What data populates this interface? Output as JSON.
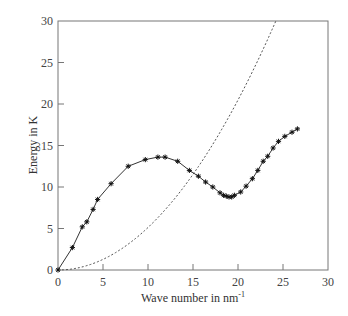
{
  "chart_data": {
    "type": "line",
    "title": "",
    "xlabel": "Wave number in nm",
    "xlabel_superscript": "-1",
    "ylabel": "Energy in K",
    "xlim": [
      0,
      30
    ],
    "ylim": [
      0,
      30
    ],
    "xticks": [
      0,
      5,
      10,
      15,
      20,
      25,
      30
    ],
    "yticks": [
      0,
      5,
      10,
      15,
      20,
      25,
      30
    ],
    "grid": false,
    "legend": null,
    "series": [
      {
        "name": "measured dispersion (markers)",
        "style": "markers-with-solid-line",
        "marker": "asterisk",
        "color": "#222222",
        "x": [
          0,
          1.6,
          2.7,
          3.2,
          3.9,
          4.4,
          5.9,
          7.8,
          9.7,
          11.1,
          11.9,
          13.3,
          14.6,
          15.6,
          16.4,
          17.2,
          18.0,
          18.4,
          18.7,
          19.0,
          19.3,
          19.6,
          20.3,
          20.9,
          21.6,
          22.2,
          22.8,
          23.3,
          23.9,
          24.5,
          25.2,
          26.0,
          26.6
        ],
        "y": [
          0,
          2.7,
          5.2,
          5.8,
          7.3,
          8.5,
          10.4,
          12.5,
          13.3,
          13.6,
          13.6,
          13.1,
          12.0,
          11.3,
          10.6,
          10.0,
          9.3,
          9.0,
          8.9,
          8.8,
          8.8,
          9.0,
          9.4,
          10.1,
          11.0,
          12.0,
          13.1,
          13.7,
          14.7,
          15.5,
          16.1,
          16.6,
          17.0
        ]
      },
      {
        "name": "free-particle parabola",
        "style": "dashed",
        "color": "#555555",
        "function": "y = 0.0512 * x^2",
        "x": [
          0,
          3,
          6,
          9,
          12,
          15,
          18,
          21,
          24.2
        ],
        "y": [
          0,
          0.46,
          1.84,
          4.15,
          7.37,
          11.52,
          16.59,
          22.58,
          30.0
        ]
      }
    ]
  }
}
